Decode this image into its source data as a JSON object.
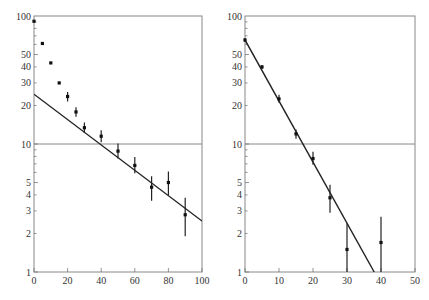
{
  "chart_data": [
    {
      "type": "scatter",
      "title": "",
      "xlabel": "",
      "ylabel": "",
      "yscale": "log",
      "xlim": [
        0,
        100
      ],
      "ylim": [
        1,
        100
      ],
      "x_ticks": [
        0,
        20,
        40,
        60,
        80,
        100
      ],
      "y_ticks": [
        1,
        2,
        3,
        4,
        5,
        10,
        20,
        30,
        40,
        50,
        100
      ],
      "reference_line_y": 10,
      "grid": false,
      "series": [
        {
          "name": "data",
          "points": [
            {
              "x": 0,
              "y": 91,
              "err": 0
            },
            {
              "x": 5,
              "y": 61,
              "err": 0
            },
            {
              "x": 10,
              "y": 43,
              "err": 0
            },
            {
              "x": 15,
              "y": 30,
              "err": 0
            },
            {
              "x": 20,
              "y": 23.5,
              "err_lo": 21.5,
              "err_hi": 25.5
            },
            {
              "x": 25,
              "y": 17.8,
              "err_lo": 16.3,
              "err_hi": 19.4
            },
            {
              "x": 30,
              "y": 13.4,
              "err_lo": 12.2,
              "err_hi": 14.7
            },
            {
              "x": 40,
              "y": 11.5,
              "err_lo": 10.3,
              "err_hi": 12.8
            },
            {
              "x": 50,
              "y": 8.8,
              "err_lo": 7.7,
              "err_hi": 10.1
            },
            {
              "x": 60,
              "y": 6.8,
              "err_lo": 5.9,
              "err_hi": 7.9
            },
            {
              "x": 70,
              "y": 4.6,
              "err_lo": 3.6,
              "err_hi": 5.6
            },
            {
              "x": 80,
              "y": 5.0,
              "err_lo": 4.0,
              "err_hi": 6.1
            },
            {
              "x": 90,
              "y": 2.8,
              "err_lo": 1.9,
              "err_hi": 3.8
            }
          ]
        },
        {
          "name": "fit",
          "type": "line",
          "x": [
            0,
            100
          ],
          "y": [
            24.5,
            2.5
          ]
        }
      ]
    },
    {
      "type": "scatter",
      "title": "",
      "xlabel": "",
      "ylabel": "",
      "yscale": "log",
      "xlim": [
        0,
        50
      ],
      "ylim": [
        1,
        100
      ],
      "x_ticks": [
        0,
        10,
        20,
        30,
        40,
        50
      ],
      "y_ticks": [
        1,
        2,
        3,
        4,
        5,
        10,
        20,
        30,
        40,
        50,
        100
      ],
      "reference_line_y": 10,
      "grid": false,
      "series": [
        {
          "name": "data",
          "points": [
            {
              "x": 0,
              "y": 65,
              "err_lo": 63,
              "err_hi": 67
            },
            {
              "x": 5,
              "y": 40,
              "err_lo": 38.5,
              "err_hi": 41.5
            },
            {
              "x": 10,
              "y": 22.5,
              "err_lo": 21,
              "err_hi": 24.2
            },
            {
              "x": 15,
              "y": 12,
              "err_lo": 11,
              "err_hi": 13
            },
            {
              "x": 20,
              "y": 7.7,
              "err_lo": 6.9,
              "err_hi": 8.7
            },
            {
              "x": 25,
              "y": 3.8,
              "err_lo": 2.9,
              "err_hi": 4.8
            },
            {
              "x": 30,
              "y": 1.5,
              "err_lo": 1.0,
              "err_hi": 2.4
            },
            {
              "x": 40,
              "y": 1.7,
              "err_lo": 1.0,
              "err_hi": 2.7
            }
          ]
        },
        {
          "name": "fit",
          "type": "line",
          "x": [
            0,
            38
          ],
          "y": [
            65,
            1
          ]
        }
      ]
    }
  ],
  "panels": [
    {
      "x_tick_labels": [
        "0",
        "20",
        "40",
        "60",
        "80",
        "100"
      ],
      "y_tick_labels": [
        "100",
        "50",
        "40",
        "30",
        "20",
        "10",
        "5",
        "4",
        "3",
        "2",
        "1"
      ]
    },
    {
      "x_tick_labels": [
        "0",
        "10",
        "20",
        "30",
        "40",
        "50"
      ],
      "y_tick_labels": [
        "100",
        "50",
        "40",
        "30",
        "20",
        "10",
        "5",
        "4",
        "3",
        "2",
        "1"
      ]
    }
  ]
}
